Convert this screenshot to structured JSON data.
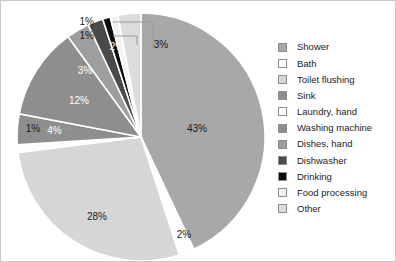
{
  "chart_data": {
    "type": "pie",
    "title": "",
    "xlabel": "",
    "ylabel": "",
    "legend_position": "right",
    "grid": false,
    "unit": "%",
    "categories": [
      "Shower",
      "Bath",
      "Toilet flushing",
      "Sink",
      "Laundry, hand",
      "Washing machine",
      "Dishes, hand",
      "Dishwasher",
      "Drinking",
      "Food processing",
      "Other"
    ],
    "values": [
      43,
      2,
      28,
      1,
      4,
      12,
      3,
      2,
      1,
      1,
      3
    ],
    "labels": [
      "43%",
      "2%",
      "28%",
      "1%",
      "4%",
      "12%",
      "3%",
      "2%",
      "1%",
      "1%",
      "3%"
    ],
    "colors": [
      "#a8a8a8",
      "#fdfdfd",
      "#d6d6d6",
      "#fdfdfd",
      "#8e8e8e",
      "#8e8e8e",
      "#9e9e9e",
      "#4a4a4a",
      "#0d0d0d",
      "#f2f2f2",
      "#dcdcdc"
    ],
    "label_colors": [
      "#1a1a1a",
      "#1a1a1a",
      "#1a1a1a",
      "#1a1a1a",
      "#ffffff",
      "#ffffff",
      "#ffffff",
      "#ffffff",
      "#1a1a1a",
      "#1a1a1a",
      "#1a1a1a"
    ]
  },
  "legend": {
    "items": [
      {
        "label": "Shower",
        "color": "#a8a8a8"
      },
      {
        "label": "Bath",
        "color": "#fdfdfd"
      },
      {
        "label": "Toilet flushing",
        "color": "#d6d6d6"
      },
      {
        "label": "Sink",
        "color": "#8e8e8e"
      },
      {
        "label": "Laundry, hand",
        "color": "#fdfdfd"
      },
      {
        "label": "Washing machine",
        "color": "#8e8e8e"
      },
      {
        "label": "Dishes, hand",
        "color": "#9e9e9e"
      },
      {
        "label": "Dishwasher",
        "color": "#4a4a4a"
      },
      {
        "label": "Drinking",
        "color": "#0d0d0d"
      },
      {
        "label": "Food processing",
        "color": "#f2f2f2"
      },
      {
        "label": "Other",
        "color": "#dcdcdc"
      }
    ]
  },
  "callouts": [
    {
      "text": "1%",
      "x": 93,
      "y": 21
    },
    {
      "text": "1%",
      "x": 93,
      "y": 35
    }
  ]
}
